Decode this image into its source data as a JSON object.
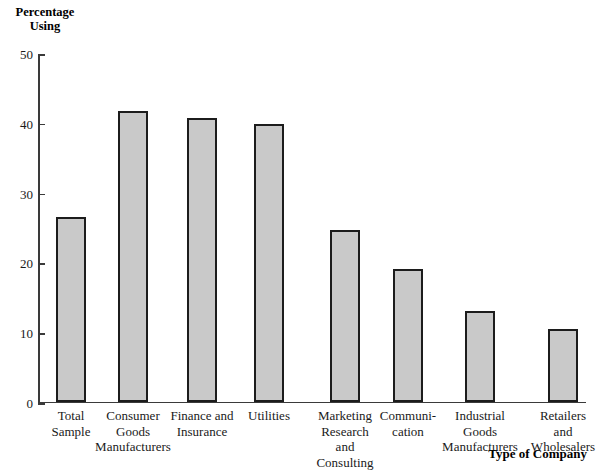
{
  "chart_data": {
    "type": "bar",
    "title": "",
    "xlabel": "Type of Company",
    "ylabel_line1": "Percentage",
    "ylabel_line2": "Using",
    "ylim": [
      0,
      50
    ],
    "ytick_labels": [
      "0",
      "10",
      "20",
      "30",
      "40",
      "50"
    ],
    "ytick_values": [
      0,
      10,
      20,
      30,
      40,
      50
    ],
    "grid": false,
    "legend": "none",
    "bar_fill_color": "#c9c9c9",
    "bar_edge_color": "#1c1c1c",
    "categories": [
      "Total Sample",
      "Consumer Goods Manufacturers",
      "Finance and Insurance",
      "Utilities",
      "Marketing Research and Consulting",
      "Communication",
      "Industrial Goods Manufacturers",
      "Retailers and Wholesalers"
    ],
    "category_label_lines": [
      [
        "Total",
        "Sample"
      ],
      [
        "Consumer",
        "Goods",
        "Manufacturers"
      ],
      [
        "Finance and",
        "Insurance"
      ],
      [
        "Utilities"
      ],
      [
        "Marketing",
        "Research",
        "and",
        "Consulting"
      ],
      [
        "Communi-",
        "cation"
      ],
      [
        "Industrial",
        "Goods",
        "Manufacturers"
      ],
      [
        "Retailers",
        "and",
        "Wholesalers"
      ]
    ],
    "values": [
      26.4,
      41.6,
      40.6,
      39.7,
      24.6,
      19.0,
      13.0,
      10.4
    ]
  }
}
